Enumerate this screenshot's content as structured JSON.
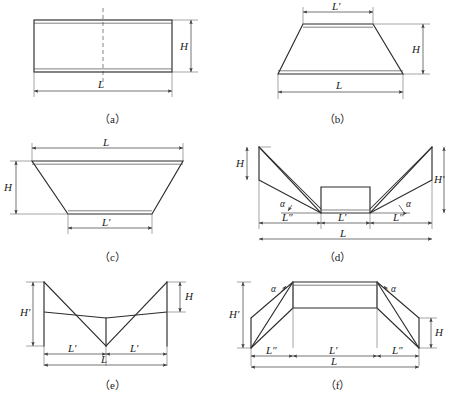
{
  "figure": {
    "type": "engineering-cross-section-diagram",
    "line_color": "#2b2b2b",
    "background": "#ffffff"
  },
  "panels": [
    {
      "id": "a",
      "caption": "（a）",
      "shape": "rectangle",
      "labels": {
        "width": "L",
        "height": "H"
      },
      "has_centerline": true
    },
    {
      "id": "b",
      "caption": "（b）",
      "shape": "trapezoid-narrow-top",
      "labels": {
        "top": "L′",
        "bottom": "L",
        "height": "H"
      },
      "has_centerline": false
    },
    {
      "id": "c",
      "caption": "（c）",
      "shape": "trapezoid-narrow-bottom",
      "labels": {
        "top": "L",
        "bottom": "L′",
        "height": "H"
      },
      "has_centerline": false
    },
    {
      "id": "d",
      "caption": "（d）",
      "shape": "flat-bottom-with-raised-outer-wings",
      "labels": {
        "inner_width": "L′",
        "wing_width_left": "L″",
        "wing_width_right": "L″",
        "total_width": "L",
        "small_height": "H",
        "large_height": "H′",
        "angle_left": "α",
        "angle_right": "α"
      },
      "has_centerline": false
    },
    {
      "id": "e",
      "caption": "（e）",
      "shape": "v-notch",
      "labels": {
        "half_width_left": "L′",
        "half_width_right": "L′",
        "total_width": "L",
        "small_height": "H",
        "large_height": "H′"
      },
      "has_centerline": false
    },
    {
      "id": "f",
      "caption": "（f）",
      "shape": "raised-flat-top-with-lowered-outer-wings",
      "labels": {
        "inner_width": "L′",
        "wing_width_left": "L″",
        "wing_width_right": "L″",
        "total_width": "L",
        "small_height": "H",
        "large_height": "H′",
        "angle_left": "α",
        "angle_right": "α"
      },
      "has_centerline": false
    }
  ]
}
